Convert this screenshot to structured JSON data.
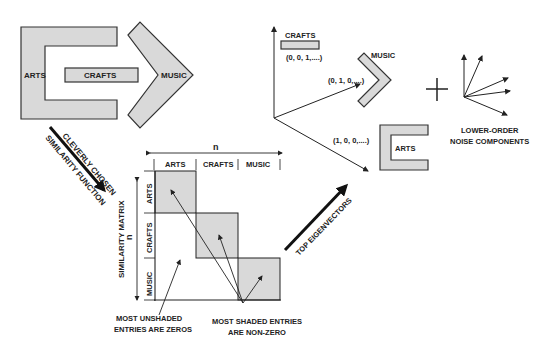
{
  "colors": {
    "shade": "#d9d9d9",
    "stroke": "#333333",
    "text": "#222222",
    "background": "#ffffff"
  },
  "shapes": {
    "arts_label": "ARTS",
    "crafts_label": "CRAFTS",
    "music_label": "MUSIC"
  },
  "arrow_left": {
    "line1": "CLEVERLY CHOSEN",
    "line2": "SIMILARITY FUNCTION"
  },
  "matrix": {
    "title": "SIMILARITY MATRIX",
    "dimension_label_top": "n",
    "dimension_label_side": "n",
    "column_headers": [
      "ARTS",
      "CRAFTS",
      "MUSIC"
    ],
    "row_headers": [
      "ARTS",
      "CRAFTS",
      "MUSIC"
    ],
    "annotation_unshaded_line1": "MOST UNSHADED",
    "annotation_unshaded_line2": "ENTRIES ARE ZEROS",
    "annotation_shaded_line1": "MOST SHADED ENTRIES",
    "annotation_shaded_line2": "ARE NON-ZERO"
  },
  "arrow_right": {
    "label": "TOP EIGENVECTORS"
  },
  "vector_space": {
    "crafts_label": "CRAFTS",
    "crafts_vector": "(0, 0, 1,....)",
    "music_label": "MUSIC",
    "music_vector": "(0, 1, 0,....)",
    "arts_label": "ARTS",
    "arts_vector": "(1, 0, 0,....)"
  },
  "noise": {
    "plus_sign": "+",
    "line1": "LOWER-ORDER",
    "line2": "NOISE COMPONENTS"
  }
}
